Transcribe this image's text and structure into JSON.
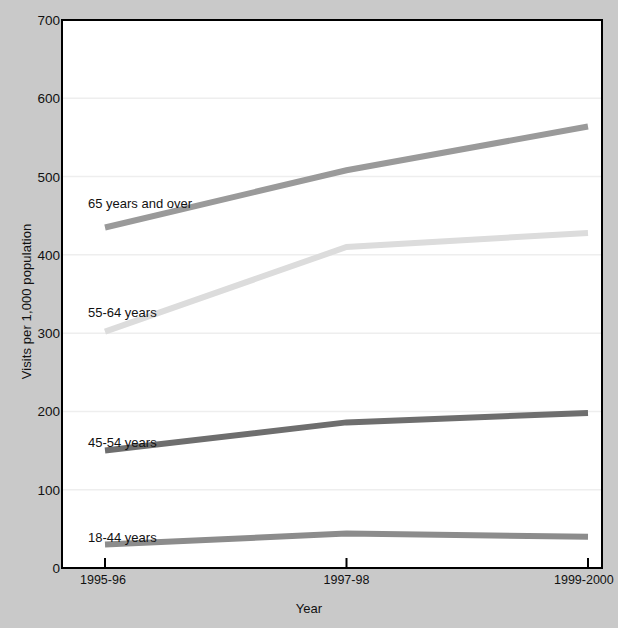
{
  "chart_data": {
    "type": "line",
    "title": "",
    "xlabel": "Year",
    "ylabel": "Visits per 1,000 population",
    "categories": [
      "1995-96",
      "1997-98",
      "1999-2000"
    ],
    "ylim": [
      0,
      700
    ],
    "yticks": [
      0,
      100,
      200,
      300,
      400,
      500,
      600,
      700
    ],
    "grid": true,
    "legend_position": "inline-labels",
    "series": [
      {
        "name": "65 years and over",
        "values": [
          435,
          508,
          564
        ],
        "color": "#9a9a9a",
        "label_x": 88,
        "label_y": 196
      },
      {
        "name": "55-64 years",
        "values": [
          302,
          410,
          428
        ],
        "color": "#dcdcdc",
        "label_x": 88,
        "label_y": 305
      },
      {
        "name": "45-54 years",
        "values": [
          150,
          186,
          198
        ],
        "color": "#6e6e6e",
        "label_x": 88,
        "label_y": 435
      },
      {
        "name": "18-44 years",
        "values": [
          30,
          44,
          40
        ],
        "color": "#8c8c8c",
        "label_x": 88,
        "label_y": 530
      }
    ]
  },
  "axes": {
    "y_tick_labels": [
      "700",
      "600",
      "500",
      "400",
      "300",
      "200",
      "100",
      "0"
    ],
    "x_tick_labels": [
      "1995-96",
      "1997-98",
      "1999-2000"
    ],
    "y_title": "Visits per 1,000 population",
    "x_title": "Year"
  },
  "style": {
    "background": "#c9c9c9",
    "plot_background": "#ffffff",
    "axis_color": "#000000",
    "grid_color": "#eeeeee"
  }
}
